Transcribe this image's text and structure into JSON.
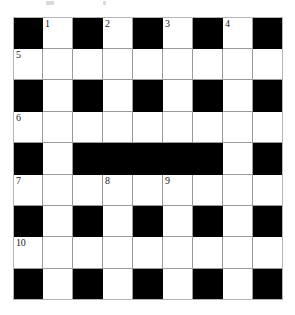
{
  "puzzle": {
    "title": "Crossword Grid",
    "type": "crossword",
    "rows": 9,
    "columns": 9,
    "cell_size_px": 30,
    "colors": {
      "block": "#000000",
      "cell": "#ffffff",
      "gridline": "#9a9a9a",
      "border": "#b5b5b5",
      "number_text": "#1a1a1a",
      "page_background": "#ffffff"
    },
    "legend": {
      "white_cell": "open letter square",
      "black_cell": "blocked square"
    },
    "layout": [
      [
        "black",
        "white",
        "black",
        "white",
        "black",
        "white",
        "black",
        "white",
        "black"
      ],
      [
        "white",
        "white",
        "white",
        "white",
        "white",
        "white",
        "white",
        "white",
        "white"
      ],
      [
        "black",
        "white",
        "black",
        "white",
        "black",
        "white",
        "black",
        "white",
        "black"
      ],
      [
        "white",
        "white",
        "white",
        "white",
        "white",
        "white",
        "white",
        "white",
        "white"
      ],
      [
        "black",
        "white",
        "black",
        "black",
        "black",
        "black",
        "black",
        "white",
        "black"
      ],
      [
        "white",
        "white",
        "white",
        "white",
        "white",
        "white",
        "white",
        "white",
        "white"
      ],
      [
        "black",
        "white",
        "black",
        "white",
        "black",
        "white",
        "black",
        "white",
        "black"
      ],
      [
        "white",
        "white",
        "white",
        "white",
        "white",
        "white",
        "white",
        "white",
        "white"
      ],
      [
        "black",
        "white",
        "black",
        "white",
        "black",
        "white",
        "black",
        "white",
        "black"
      ]
    ],
    "numbers": [
      {
        "number": "1",
        "row": 1,
        "col": 2
      },
      {
        "number": "2",
        "row": 1,
        "col": 4
      },
      {
        "number": "3",
        "row": 1,
        "col": 6
      },
      {
        "number": "4",
        "row": 1,
        "col": 8
      },
      {
        "number": "5",
        "row": 2,
        "col": 1
      },
      {
        "number": "6",
        "row": 4,
        "col": 1
      },
      {
        "number": "7",
        "row": 6,
        "col": 1
      },
      {
        "number": "8",
        "row": 6,
        "col": 4
      },
      {
        "number": "9",
        "row": 6,
        "col": 6
      },
      {
        "number": "10",
        "row": 8,
        "col": 1
      }
    ],
    "artifacts": [
      {
        "name": "scan-mark-left"
      },
      {
        "name": "scan-mark-right"
      }
    ]
  }
}
